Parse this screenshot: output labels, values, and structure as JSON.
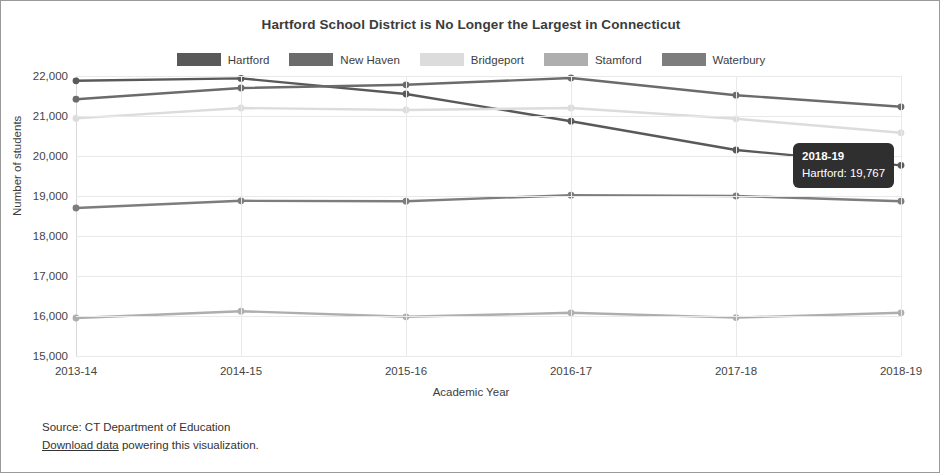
{
  "chart_data": {
    "type": "line",
    "title": "Hartford School District is No Longer the Largest in Connecticut",
    "xlabel": "Academic Year",
    "ylabel": "Number of students",
    "categories": [
      "2013-14",
      "2014-15",
      "2015-16",
      "2016-17",
      "2017-18",
      "2018-19"
    ],
    "ylim": [
      15000,
      22000
    ],
    "yticks": [
      "15,000",
      "16,000",
      "17,000",
      "18,000",
      "19,000",
      "20,000",
      "21,000",
      "22,000"
    ],
    "ytick_values": [
      15000,
      16000,
      17000,
      18000,
      19000,
      20000,
      21000,
      22000
    ],
    "grid": true,
    "legend_position": "top",
    "series": [
      {
        "name": "Hartford",
        "color": "#595959",
        "values": [
          21880,
          21940,
          21550,
          20870,
          20150,
          19767
        ]
      },
      {
        "name": "New Haven",
        "color": "#6b6b6b",
        "values": [
          21420,
          21700,
          21780,
          21950,
          21520,
          21230
        ]
      },
      {
        "name": "Bridgeport",
        "color": "#dcdcdc",
        "values": [
          20940,
          21200,
          21150,
          21200,
          20930,
          20580
        ]
      },
      {
        "name": "Stamford",
        "color": "#aeaeae",
        "values": [
          15950,
          16120,
          15980,
          16080,
          15960,
          16080
        ]
      },
      {
        "name": "Waterbury",
        "color": "#7d7d7d",
        "values": [
          18700,
          18880,
          18870,
          19020,
          19000,
          18870
        ]
      }
    ]
  },
  "tooltip": {
    "title": "2018-19",
    "row": "Hartford: 19,767"
  },
  "footer": {
    "source": "Source: CT Department of Education",
    "link_text": "Download data",
    "link_suffix": " powering this visualization."
  }
}
